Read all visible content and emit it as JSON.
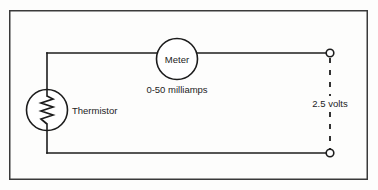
{
  "figure": {
    "background_color": "#fdfdfc",
    "line_color": "#1c1c1c",
    "frame_color": "#3a3a3a"
  },
  "frame": {
    "name": "diagram-border",
    "x": 9,
    "y": 10,
    "width": 359,
    "height": 170
  },
  "components": {
    "meter": {
      "label": "Meter",
      "range_label": "0-50 milliamps",
      "cx": 177,
      "cy": 59,
      "r": 20.5
    },
    "thermistor": {
      "label": "Thermistor",
      "cx": 47,
      "cy": 110,
      "r": 20.5,
      "zigzag_peaks": 6
    },
    "source": {
      "label": "2.5 volts",
      "terminal_top": {
        "x": 330,
        "y": 53,
        "r": 4
      },
      "terminal_bottom": {
        "x": 330,
        "y": 153,
        "r": 4
      },
      "connection_style": "dashed"
    }
  },
  "wires": [
    {
      "name": "top-left-wire",
      "from_x": 47,
      "from_y": 53,
      "to_x": 156.5,
      "to_y": 53
    },
    {
      "name": "top-right-wire",
      "from_x": 197.5,
      "from_y": 53,
      "to_x": 330,
      "to_y": 53
    },
    {
      "name": "thermistor-top-lead",
      "from_x": 47,
      "from_y": 53,
      "to_x": 47,
      "to_y": 89.5
    },
    {
      "name": "thermistor-bottom-lead",
      "from_x": 47,
      "from_y": 130.5,
      "to_x": 47,
      "to_y": 153
    },
    {
      "name": "bottom-wire",
      "from_x": 47,
      "from_y": 153,
      "to_x": 330,
      "to_y": 153
    }
  ],
  "labels": {
    "meter_text": "Meter",
    "range_text": "0-50 milliamps",
    "thermistor_text": "Thermistor",
    "volts_text": "2.5 volts"
  }
}
